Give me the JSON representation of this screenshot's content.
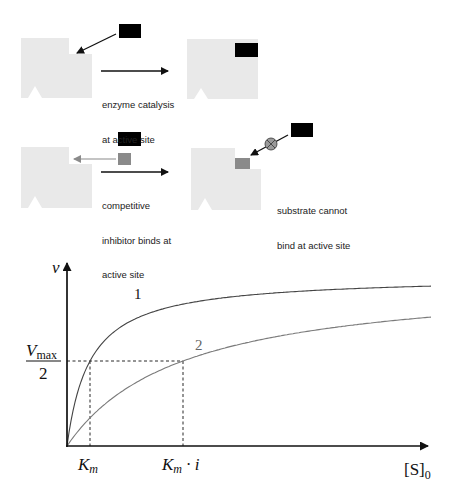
{
  "scenes": [
    {
      "id": "catalysis",
      "caption_lines": [
        "enzyme catalysis",
        "at active site"
      ],
      "substrate_color": "#000000",
      "enzyme_color": "#e9e9e9"
    },
    {
      "id": "competitive-inhibition",
      "caption_lines": [
        "competitive",
        "inhibitor binds at",
        "active site"
      ],
      "inhibitor_color": "#8a8a8a",
      "result_caption_lines": [
        "substrate cannot",
        "bind at active site"
      ],
      "blocked_icon": "circle-x-icon"
    }
  ],
  "chart_data": {
    "type": "line",
    "title": "",
    "xlabel": "[S]0",
    "ylabel": "v",
    "grid": false,
    "legend": "none",
    "series": [
      {
        "name": "1",
        "label": "1",
        "description": "no inhibitor",
        "Km_rel": 1,
        "Vmax_rel": 1
      },
      {
        "name": "2",
        "label": "2",
        "description": "with competitive inhibitor",
        "Km_rel": "i",
        "Vmax_rel": 1
      }
    ],
    "annotations": [
      {
        "axis": "y",
        "label": "Vmax/2",
        "numerator": "V",
        "numerator_sub": "max",
        "denominator": "2",
        "style": "dashed"
      },
      {
        "axis": "x",
        "label": "Km",
        "base": "K",
        "sub": "m",
        "style": "dashed"
      },
      {
        "axis": "x",
        "label": "Km · i",
        "base": "K",
        "sub": "m",
        "suffix": " · i",
        "style": "dashed"
      }
    ],
    "ylabel_text": "v",
    "xlabel_text": "[S]",
    "xlabel_sub": "0",
    "curve_labels": [
      "1",
      "2"
    ]
  }
}
